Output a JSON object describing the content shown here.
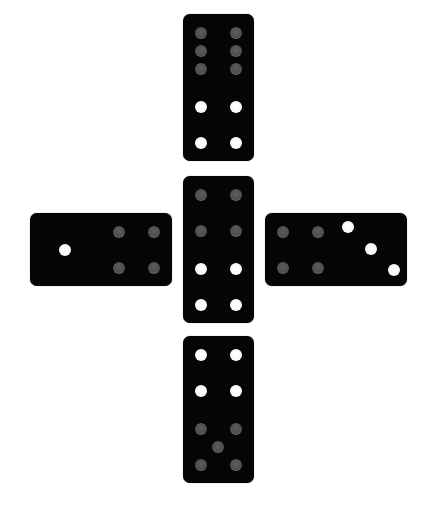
{
  "board": {
    "background": "#ffffff",
    "domino_color": "#050505",
    "pip_colors": {
      "grey": "#555555",
      "white": "#ffffff"
    }
  },
  "dominoes": [
    {
      "id": "top",
      "orientation": "vertical",
      "position": {
        "x": 183,
        "y": 14
      },
      "halves": [
        {
          "value": 6,
          "pip_color": "grey"
        },
        {
          "value": 4,
          "pip_color": "white"
        }
      ]
    },
    {
      "id": "center",
      "orientation": "vertical",
      "position": {
        "x": 183,
        "y": 176
      },
      "halves": [
        {
          "value": 4,
          "pip_color": "grey"
        },
        {
          "value": 4,
          "pip_color": "white"
        }
      ]
    },
    {
      "id": "bottom",
      "orientation": "vertical",
      "position": {
        "x": 183,
        "y": 336
      },
      "halves": [
        {
          "value": 4,
          "pip_color": "white"
        },
        {
          "value": 5,
          "pip_color": "grey"
        }
      ]
    },
    {
      "id": "left",
      "orientation": "horizontal",
      "position": {
        "x": 30,
        "y": 213
      },
      "halves": [
        {
          "value": 1,
          "pip_color": "white"
        },
        {
          "value": 4,
          "pip_color": "grey"
        }
      ]
    },
    {
      "id": "right",
      "orientation": "horizontal",
      "position": {
        "x": 265,
        "y": 213
      },
      "halves": [
        {
          "value": 4,
          "pip_color": "grey"
        },
        {
          "value": 3,
          "pip_color": "white"
        }
      ]
    }
  ]
}
